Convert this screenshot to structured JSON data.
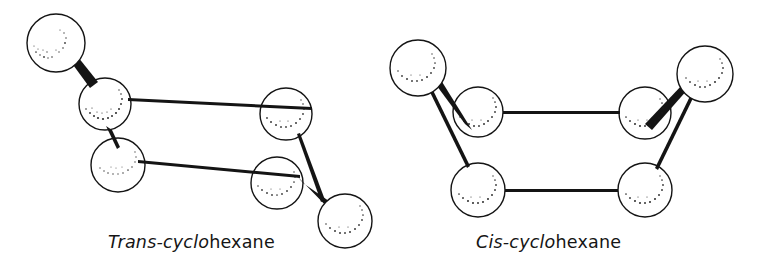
{
  "figure": {
    "background_color": "#ffffff",
    "ink_color": "#141414",
    "style": "hand-drawn ball-and-stick line illustration with stippled sphere shading"
  },
  "captions": {
    "left": {
      "stereo_prefix": "Trans-cyclo",
      "suffix": "hexane",
      "full_text": "Trans-cyclohexane"
    },
    "right": {
      "stereo_prefix": "Cis-cyclo",
      "suffix": "hexane",
      "full_text": "Cis-cyclohexane"
    }
  },
  "molecules": [
    {
      "name": "trans-cyclohexane",
      "label": "Trans-cyclohexane",
      "atoms": [
        {
          "id": "t-sub-top",
          "cx": 56,
          "cy": 43,
          "r": 29,
          "role": "substituent"
        },
        {
          "id": "t-ring-1",
          "cx": 105,
          "cy": 104,
          "r": 26,
          "role": "ring"
        },
        {
          "id": "t-ring-2",
          "cx": 118,
          "cy": 165,
          "r": 27,
          "role": "ring"
        },
        {
          "id": "t-ring-3",
          "cx": 286,
          "cy": 114,
          "r": 26,
          "role": "ring"
        },
        {
          "id": "t-ring-4",
          "cx": 277,
          "cy": 183,
          "r": 26,
          "role": "ring"
        },
        {
          "id": "t-sub-bottom",
          "cx": 345,
          "cy": 221,
          "r": 27,
          "role": "substituent"
        }
      ],
      "bonds": [
        {
          "from": "t-ring-1",
          "to": "t-sub-top",
          "type": "wedge"
        },
        {
          "from": "t-ring-1",
          "to": "t-ring-3",
          "type": "plain"
        },
        {
          "from": "t-ring-1",
          "to": "t-ring-2",
          "type": "stub"
        },
        {
          "from": "t-ring-2",
          "to": "t-ring-4",
          "type": "plain"
        },
        {
          "from": "t-ring-3",
          "to": "t-ring-4",
          "type": "plain"
        },
        {
          "from": "t-ring-4",
          "to": "t-sub-bottom",
          "type": "wedge"
        }
      ]
    },
    {
      "name": "cis-cyclohexane",
      "label": "Cis-cyclohexane",
      "atoms": [
        {
          "id": "c-sub-left",
          "cx": 418,
          "cy": 68,
          "r": 28,
          "role": "substituent"
        },
        {
          "id": "c-ring-1",
          "cx": 478,
          "cy": 112,
          "r": 25,
          "role": "ring"
        },
        {
          "id": "c-ring-2",
          "cx": 478,
          "cy": 190,
          "r": 27,
          "role": "ring"
        },
        {
          "id": "c-ring-3",
          "cx": 645,
          "cy": 113,
          "r": 26,
          "role": "ring"
        },
        {
          "id": "c-ring-4",
          "cx": 645,
          "cy": 190,
          "r": 27,
          "role": "ring"
        },
        {
          "id": "c-sub-right",
          "cx": 705,
          "cy": 74,
          "r": 28,
          "role": "substituent"
        }
      ],
      "bonds": [
        {
          "from": "c-ring-1",
          "to": "c-sub-left",
          "type": "wedge"
        },
        {
          "from": "c-sub-left",
          "to": "c-ring-2",
          "type": "plain"
        },
        {
          "from": "c-ring-1",
          "to": "c-ring-3",
          "type": "plain"
        },
        {
          "from": "c-ring-2",
          "to": "c-ring-4",
          "type": "plain"
        },
        {
          "from": "c-ring-3",
          "to": "c-sub-right",
          "type": "wedge"
        },
        {
          "from": "c-sub-right",
          "to": "c-ring-4",
          "type": "plain"
        }
      ]
    }
  ]
}
